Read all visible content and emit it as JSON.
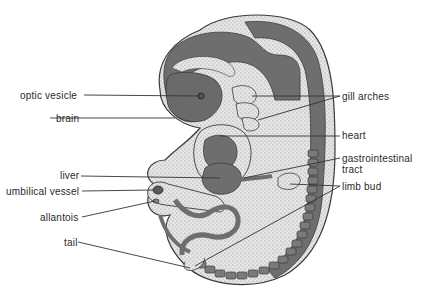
{
  "figure": {
    "labels_left": [
      {
        "id": "optic-vesicle",
        "text": "optic vesicle",
        "x": 20,
        "y": 90
      },
      {
        "id": "brain",
        "text": "brain",
        "x": 56,
        "y": 113
      },
      {
        "id": "liver",
        "text": "liver",
        "x": 60,
        "y": 170
      },
      {
        "id": "umbilical-vessel",
        "text": "umbilical vessel",
        "x": 6,
        "y": 186
      },
      {
        "id": "allantois",
        "text": "allantois",
        "x": 40,
        "y": 212
      },
      {
        "id": "tail",
        "text": "tail",
        "x": 64,
        "y": 237
      }
    ],
    "labels_right": [
      {
        "id": "gill-arches",
        "text": "gill arches",
        "x": 342,
        "y": 91
      },
      {
        "id": "heart",
        "text": "heart",
        "x": 342,
        "y": 130
      },
      {
        "id": "gastrointestinal-tract",
        "text": "gastrointestinal",
        "text2": "tract",
        "x": 342,
        "y": 153
      },
      {
        "id": "limb-bud",
        "text": "limb bud",
        "x": 342,
        "y": 181
      }
    ],
    "colors": {
      "outline": "#3a3a3a",
      "dark_tissue": "#6e6e6e",
      "light_tissue": "#d9d9d9",
      "label_text": "#2a2a2a",
      "leader_line": "#333333"
    }
  }
}
